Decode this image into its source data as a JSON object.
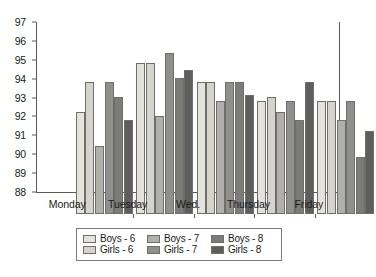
{
  "chart_data": {
    "type": "bar",
    "title": "",
    "subtitle": "",
    "xlabel": "",
    "ylabel": "",
    "categories": [
      "Monday",
      "Tuesday",
      "Wed.",
      "Thursday",
      "Friday"
    ],
    "ylim": [
      88,
      97
    ],
    "ytick_labels": [
      "97",
      "96",
      "95",
      "94",
      "93",
      "92",
      "91",
      "90",
      "89",
      "88"
    ],
    "yticks": [
      97,
      96,
      95,
      94,
      93,
      92,
      91,
      90,
      89,
      88
    ],
    "grid": false,
    "legend_position": "bottom",
    "series": [
      {
        "name": "Boys - 6",
        "color": "#e3e3dc",
        "values": [
          93.4,
          96.0,
          95.0,
          94.0,
          94.0
        ]
      },
      {
        "name": "Girls - 6",
        "color": "#d4d4cc",
        "values": [
          95.0,
          96.0,
          95.0,
          94.2,
          94.0
        ]
      },
      {
        "name": "Boys - 7",
        "color": "#b0b0ab",
        "values": [
          91.6,
          93.2,
          94.0,
          93.4,
          93.0
        ]
      },
      {
        "name": "Girls - 7",
        "color": "#8f8f8c",
        "values": [
          95.0,
          96.55,
          95.0,
          94.0,
          94.0
        ]
      },
      {
        "name": "Boys - 8",
        "color": "#7b7b78",
        "values": [
          94.2,
          95.2,
          95.0,
          93.0,
          91.0
        ]
      },
      {
        "name": "Girls - 8",
        "color": "#5e5e5c",
        "values": [
          93.0,
          95.6,
          94.3,
          95.0,
          92.4
        ]
      }
    ]
  },
  "legend": {
    "rows": [
      [
        {
          "label": "Boys - 6",
          "swatch": "#e3e3dc"
        },
        {
          "label": "Boys - 7",
          "swatch": "#b0b0ab"
        },
        {
          "label": "Boys - 8",
          "swatch": "#7b7b78"
        }
      ],
      [
        {
          "label": "Girls - 6",
          "swatch": "#d4d4cc"
        },
        {
          "label": "Girls - 7",
          "swatch": "#8f8f8c"
        },
        {
          "label": "Girls - 8",
          "swatch": "#5e5e5c"
        }
      ]
    ]
  }
}
